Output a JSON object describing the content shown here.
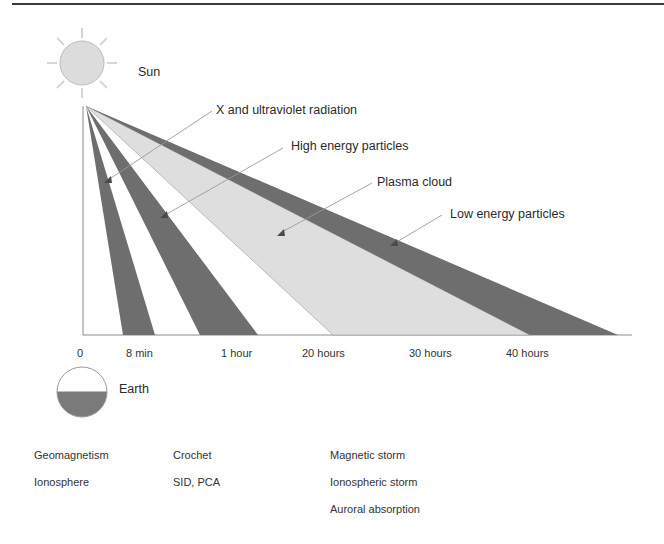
{
  "figure": {
    "sun_label": "Sun",
    "earth_label": "Earth",
    "emissions": [
      {
        "label": "X and ultraviolet radiation",
        "shade": "dark"
      },
      {
        "label": "High energy particles",
        "shade": "dark"
      },
      {
        "label": "Plasma cloud",
        "shade": "light"
      },
      {
        "label": "Low energy particles",
        "shade": "dark"
      }
    ],
    "time_axis": [
      "0",
      "8 min",
      "1 hour",
      "20  hours",
      "30 hours",
      "40 hours"
    ],
    "effects": {
      "row1": [
        "Geomagnetism",
        "Crochet",
        "Magnetic storm"
      ],
      "row2": [
        "Ionosphere",
        "SID, PCA",
        "Ionospheric storm"
      ],
      "row3": [
        "Auroral absorption"
      ]
    },
    "colors": {
      "dark_band": "#6e6e6e",
      "light_band": "#dedede",
      "sun_fill": "#dcdcdc",
      "earth_lower": "#7a7a7a",
      "line": "#8a8a8a"
    }
  }
}
